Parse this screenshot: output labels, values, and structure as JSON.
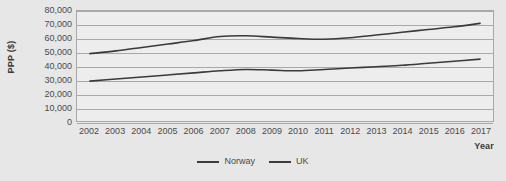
{
  "chart_data": {
    "type": "line",
    "title": "",
    "xlabel": "Year",
    "ylabel": "PPP ($)",
    "ylim": [
      0,
      80000
    ],
    "ytick_step": 10000,
    "grid": true,
    "legend_position": "bottom",
    "y_ticks": [
      "0",
      "10,000",
      "20,000",
      "30,000",
      "40,000",
      "50,000",
      "60,000",
      "70,000",
      "80,000"
    ],
    "categories": [
      "2002",
      "2003",
      "2004",
      "2005",
      "2006",
      "2007",
      "2008",
      "2009",
      "2010",
      "2011",
      "2012",
      "2013",
      "2014",
      "2015",
      "2016",
      "2017"
    ],
    "series": [
      {
        "name": "Norway",
        "color": "#3a3a3a",
        "values": [
          49000,
          51000,
          53500,
          56000,
          58500,
          61500,
          62000,
          61000,
          60000,
          59500,
          60500,
          62500,
          64500,
          66500,
          68500,
          71000
        ]
      },
      {
        "name": "UK",
        "color": "#3a3a3a",
        "values": [
          29000,
          30500,
          32000,
          33500,
          35000,
          36500,
          37500,
          37000,
          36500,
          37500,
          38500,
          39500,
          40500,
          42000,
          43500,
          45000
        ]
      }
    ]
  },
  "axes": {
    "y_title": "PPP ($)",
    "x_title": "Year"
  },
  "legend": {
    "entries": [
      {
        "label": "Norway"
      },
      {
        "label": "UK"
      }
    ]
  },
  "colors": {
    "page_background": "#e7e7e7",
    "plot_background": "#ededed",
    "gridline": "#a9a9a9",
    "axis_text": "#4a4a4a",
    "title_text": "#3b3b3b",
    "series_norway": "#3a3a3a",
    "series_uk": "#3a3a3a"
  }
}
